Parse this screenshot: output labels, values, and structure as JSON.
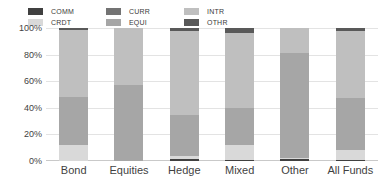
{
  "chart_data": {
    "type": "bar",
    "title": "",
    "subtitle": "",
    "xlabel": "",
    "ylabel": "",
    "stacked": true,
    "normalized_percent": true,
    "grid": true,
    "legend_position": "top",
    "ylim": [
      0,
      100
    ],
    "yticks": [
      "0%",
      "20%",
      "40%",
      "60%",
      "80%",
      "100%"
    ],
    "ytick_values": [
      0,
      20,
      40,
      60,
      80,
      100
    ],
    "categories": [
      "Bond",
      "Equities",
      "Hedge",
      "Mixed",
      "Other",
      "All Funds"
    ],
    "series": [
      {
        "name": "COMM",
        "color": "#404040",
        "values": [
          0.0,
          0.0,
          1.5,
          1.0,
          1.5,
          0.5
        ]
      },
      {
        "name": "CRDT",
        "color": "#d9d9d9",
        "values": [
          12.0,
          0.0,
          2.0,
          11.0,
          0.5,
          8.0
        ]
      },
      {
        "name": "CURR",
        "color": "#737373",
        "values": [
          0.0,
          0.0,
          0.0,
          0.0,
          0.0,
          0.0
        ]
      },
      {
        "name": "EQUI",
        "color": "#a6a6a6",
        "values": [
          36.0,
          57.0,
          31.0,
          28.0,
          79.0,
          39.0
        ]
      },
      {
        "name": "INTR",
        "color": "#bfbfbf",
        "values": [
          50.5,
          43.0,
          63.5,
          56.0,
          19.0,
          50.0
        ]
      },
      {
        "name": "OTHR",
        "color": "#595959",
        "values": [
          1.5,
          0.0,
          2.0,
          4.0,
          0.0,
          2.5
        ]
      }
    ],
    "stack_order_bottom_to_top": [
      "COMM",
      "CRDT",
      "CURR",
      "EQUI",
      "INTR",
      "OTHR"
    ]
  },
  "legend": {
    "items": [
      {
        "label": "COMM",
        "color": "#404040"
      },
      {
        "label": "CRDT",
        "color": "#d9d9d9"
      },
      {
        "label": "CURR",
        "color": "#737373"
      },
      {
        "label": "EQUI",
        "color": "#a6a6a6"
      },
      {
        "label": "INTR",
        "color": "#bfbfbf"
      },
      {
        "label": "OTHR",
        "color": "#595959"
      }
    ]
  },
  "colors": {
    "background": "#ffffff",
    "gridline": "#e3e3e3",
    "axis": "#c9c9c9",
    "text": "#3f3f3f"
  }
}
